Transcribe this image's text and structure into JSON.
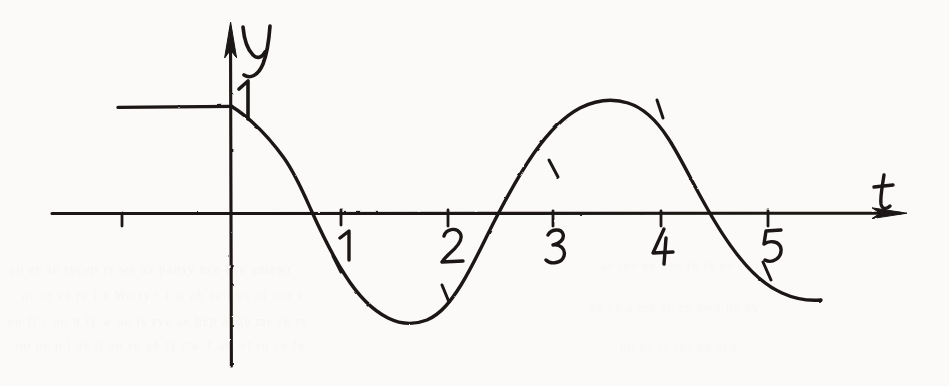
{
  "figure": {
    "background_color": "#fbfaf8",
    "ink_color": "#1a1714"
  },
  "axes": {
    "x_axis": {
      "label": "t",
      "label_x": 884,
      "label_y": 196,
      "arrow": true,
      "y_pixel": 214,
      "start_x": 52,
      "end_x": 908
    },
    "y_axis": {
      "label": "y",
      "label_x": 246,
      "label_y": 44,
      "arrow": true,
      "x_pixel": 231,
      "top_y": 22,
      "bottom_y": 366
    },
    "origin": {
      "x": 231,
      "y": 214
    },
    "pixels_per_unit_x": 107,
    "pixels_per_unit_y": 108,
    "x_tick_labels": [
      "1",
      "2",
      "3",
      "4",
      "5"
    ],
    "x_tick_values": [
      1,
      2,
      3,
      4,
      5
    ],
    "x_tick_unlabeled_values": [
      -1
    ],
    "y_tick_labels": [
      "1"
    ],
    "y_tick_values": [
      1
    ]
  },
  "chart_data": {
    "type": "line",
    "title": "",
    "xlabel": "t",
    "ylabel": "y",
    "xlim": [
      -1.7,
      6.3
    ],
    "ylim": [
      -1.4,
      1.8
    ],
    "grid": false,
    "legend": null,
    "annotations": [
      {
        "text": "1",
        "x": 0.13,
        "y": 1.2,
        "role": "y-axis-unit-label"
      },
      {
        "text": "1",
        "x": 1.0,
        "y": -0.21,
        "role": "x-tick-label"
      },
      {
        "text": "2",
        "x": 2.0,
        "y": -0.21,
        "role": "x-tick-label"
      },
      {
        "text": "3",
        "x": 3.0,
        "y": -0.21,
        "role": "x-tick-label"
      },
      {
        "text": "4",
        "x": 4.0,
        "y": -0.21,
        "role": "x-tick-label"
      },
      {
        "text": "5",
        "x": 5.0,
        "y": -0.21,
        "role": "x-tick-label"
      }
    ],
    "series": [
      {
        "name": "y = 1 (for t < 0)",
        "style": "solid",
        "x": [
          -1.68,
          0.0
        ],
        "values": [
          1.0,
          1.0
        ]
      },
      {
        "name": "y = cos(pi*t/1.6) damped wave (for t >= 0)",
        "style": "solid",
        "x": [
          0.0,
          0.2,
          0.4,
          0.66,
          0.9,
          1.2,
          1.6,
          2.0,
          2.3,
          2.62,
          3.0,
          3.3,
          3.7,
          4.1,
          4.4,
          4.7,
          5.0,
          5.3,
          5.5
        ],
        "values": [
          1.0,
          0.82,
          0.55,
          0.0,
          -0.45,
          -0.84,
          -1.0,
          -0.82,
          -0.45,
          0.0,
          0.55,
          0.85,
          1.0,
          0.82,
          0.45,
          0.0,
          -0.45,
          -0.76,
          -0.82
        ]
      }
    ],
    "curve_markers": [
      {
        "x": 1.0,
        "y": -0.46,
        "label": "hash-mark"
      },
      {
        "x": 2.0,
        "y": -0.72,
        "label": "hash-mark"
      },
      {
        "x": 3.0,
        "y": 0.43,
        "label": "hash-mark"
      },
      {
        "x": 4.0,
        "y": 0.96,
        "label": "hash-mark"
      },
      {
        "x": 5.0,
        "y": -0.45,
        "label": "hash-mark"
      }
    ]
  },
  "paper_bleed_text": [
    {
      "text": "co  er  ae  recep  rs  we  as  pansy  nce  ose  amewr",
      "x": 10,
      "y": 262,
      "opacity": 0.2
    },
    {
      "text": "oe  m  ve  ry  i  e  Wo  ty  t  f  w  eh  ee  i  bs  of  oot  s",
      "x": 22,
      "y": 288,
      "opacity": 0.18
    },
    {
      "text": "eo  ft  c  po  n  iy  w  oe  ts  rye  ae  hcp  ange  me  re  rs",
      "x": 8,
      "y": 314,
      "opacity": 0.2
    },
    {
      "text": "oo  oe  n  i  ae  tt  eo  se  gh  ty  ow  T  ae  wt  ro  ce  fe",
      "x": 16,
      "y": 338,
      "opacity": 0.18
    },
    {
      "text": "ae  ree  ee  bee  re  te  ee  oe",
      "x": 600,
      "y": 258,
      "opacity": 0.16
    },
    {
      "text": "ee  ce  a  me  se  ee  ewe  he  ey",
      "x": 590,
      "y": 300,
      "opacity": 0.15
    },
    {
      "text": "on  ee  te  res  ee  eye",
      "x": 620,
      "y": 340,
      "opacity": 0.14
    }
  ]
}
